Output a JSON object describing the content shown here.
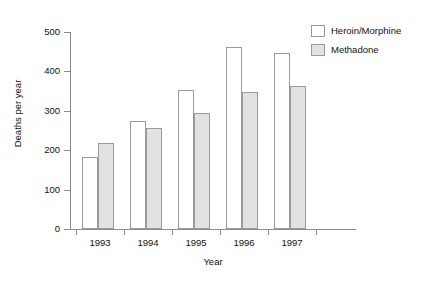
{
  "chart_data": {
    "type": "bar",
    "title": "",
    "xlabel": "Year",
    "ylabel": "Deaths per year",
    "categories": [
      "1993",
      "1994",
      "1995",
      "1996",
      "1997"
    ],
    "series": [
      {
        "name": "Heroin/Morphine",
        "values": [
          183,
          274,
          353,
          462,
          446
        ],
        "color": "#ffffff"
      },
      {
        "name": "Methadone",
        "values": [
          218,
          257,
          294,
          348,
          364
        ],
        "color": "#e2e2e2"
      }
    ],
    "ylim": [
      0,
      500
    ],
    "yticks": [
      0,
      100,
      200,
      300,
      400,
      500
    ],
    "ytick_labels": [
      "0",
      "100",
      "200",
      "300",
      "400",
      "500"
    ],
    "grid": false,
    "legend_position": "top-right"
  },
  "legend": {
    "entries": [
      {
        "label": "Heroin/Morphine"
      },
      {
        "label": "Methadone"
      }
    ]
  },
  "axes": {
    "x_title": "Year",
    "y_title": "Deaths per year"
  }
}
